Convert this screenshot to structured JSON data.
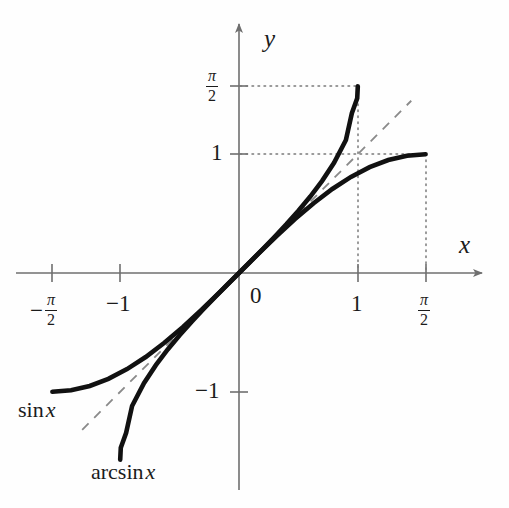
{
  "figure": {
    "background_color": "#fefefe",
    "ink_color": "#1b1b1b",
    "axis_color": "#6f6f6f",
    "guide_color": "#7a7a7a",
    "dashed_color": "#8a8a8a"
  },
  "axes": {
    "x_name": "x",
    "y_name": "y",
    "origin_label": "0"
  },
  "ticks": {
    "x": [
      {
        "value": -1.5708,
        "label_kind": "frac",
        "sign": "−",
        "num": "π",
        "den": "2"
      },
      {
        "value": -1,
        "label_kind": "plain",
        "text": "−1"
      },
      {
        "value": 1,
        "label_kind": "plain",
        "text": "1"
      },
      {
        "value": 1.5708,
        "label_kind": "frac",
        "sign": "",
        "num": "π",
        "den": "2"
      }
    ],
    "y": [
      {
        "value": 1.5708,
        "label_kind": "frac",
        "sign": "",
        "num": "π",
        "den": "2"
      },
      {
        "value": 1,
        "label_kind": "plain",
        "text": "1"
      },
      {
        "value": -1,
        "label_kind": "plain",
        "text": "−1"
      }
    ]
  },
  "curve_labels": {
    "sin": {
      "name": "sin",
      "arg": "x"
    },
    "arcsin": {
      "name": "arcsin",
      "arg": "x"
    }
  },
  "chart_data": {
    "type": "line",
    "title": "",
    "xlabel": "x",
    "ylabel": "y",
    "grid": false,
    "legend": "inline-curve-labels",
    "xlim": [
      -2.05,
      2.07
    ],
    "ylim": [
      -2.15,
      2.15
    ],
    "xticks": [
      -1.5708,
      -1,
      0,
      1,
      1.5708
    ],
    "xticklabels": [
      "-π/2",
      "-1",
      "0",
      "1",
      "π/2"
    ],
    "yticks": [
      -1,
      1,
      1.5708
    ],
    "yticklabels": [
      "-1",
      "1",
      "π/2"
    ],
    "series": [
      {
        "name": "sin x",
        "style": "solid-thick",
        "color": "#111111",
        "domain": [
          -1.5708,
          1.5708
        ],
        "formula": "y = sin(x)",
        "endpoints": [
          [
            -1.5708,
            -1
          ],
          [
            1.5708,
            1
          ]
        ],
        "x": [
          -1.5708,
          -1.4137,
          -1.2566,
          -1.0996,
          -0.9425,
          -0.7854,
          -0.6283,
          -0.4712,
          -0.3142,
          -0.1571,
          0,
          0.1571,
          0.3142,
          0.4712,
          0.6283,
          0.7854,
          0.9425,
          1.0996,
          1.2566,
          1.4137,
          1.5708
        ],
        "y": [
          -1,
          -0.9877,
          -0.9511,
          -0.891,
          -0.809,
          -0.7071,
          -0.5878,
          -0.454,
          -0.309,
          -0.1564,
          0,
          0.1564,
          0.309,
          0.454,
          0.5878,
          0.7071,
          0.809,
          0.891,
          0.9511,
          0.9877,
          1
        ]
      },
      {
        "name": "arcsin x",
        "style": "solid-thick",
        "color": "#111111",
        "domain": [
          -1,
          1
        ],
        "formula": "y = arcsin(x)",
        "endpoints": [
          [
            -1,
            -1.5708
          ],
          [
            1,
            1.5708
          ]
        ],
        "x": [
          -1,
          -0.995,
          -0.98,
          -0.95,
          -0.9,
          -0.8,
          -0.7,
          -0.6,
          -0.5,
          -0.4,
          -0.3,
          -0.2,
          -0.1,
          0,
          0.1,
          0.2,
          0.3,
          0.4,
          0.5,
          0.6,
          0.7,
          0.8,
          0.9,
          0.95,
          0.98,
          0.995,
          1
        ],
        "y": [
          -1.5708,
          -1.4709,
          -1.4289,
          -1.3453,
          -1.1198,
          -0.9273,
          -0.7754,
          -0.6435,
          -0.5236,
          -0.4115,
          -0.3047,
          -0.2014,
          -0.1002,
          0,
          0.1002,
          0.2014,
          0.3047,
          0.4115,
          0.5236,
          0.6435,
          0.7754,
          0.9273,
          1.1198,
          1.3453,
          1.4289,
          1.4709,
          1.5708
        ]
      },
      {
        "name": "y = x",
        "style": "dashed-thin",
        "color": "#8a8a8a",
        "formula": "y = x",
        "endpoints": [
          [
            -1.32,
            -1.32
          ],
          [
            1.45,
            1.45
          ]
        ]
      }
    ],
    "annotations": [
      {
        "text": "sin x",
        "x": -1.58,
        "y": -1.12,
        "anchor": "left"
      },
      {
        "text": "arcsin x",
        "x": -1.06,
        "y": -1.62,
        "anchor": "left"
      }
    ],
    "guides": [
      {
        "kind": "dotted",
        "from": [
          0,
          1.5708
        ],
        "to": [
          1,
          1.5708
        ]
      },
      {
        "kind": "dotted",
        "from": [
          1,
          1.5708
        ],
        "to": [
          1,
          0
        ]
      },
      {
        "kind": "dotted",
        "from": [
          0,
          1
        ],
        "to": [
          1.5708,
          1
        ]
      },
      {
        "kind": "dotted",
        "from": [
          1.5708,
          1
        ],
        "to": [
          1.5708,
          0
        ]
      }
    ]
  }
}
